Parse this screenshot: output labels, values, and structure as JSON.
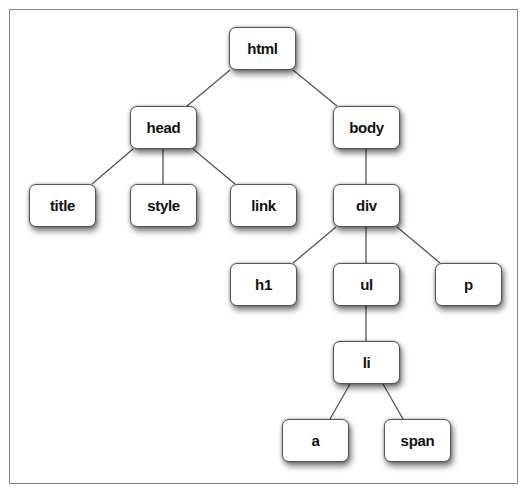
{
  "diagram": {
    "type": "tree",
    "nodes": [
      {
        "id": "html",
        "label": "html",
        "x": 229,
        "y": 27
      },
      {
        "id": "head",
        "label": "head",
        "x": 130,
        "y": 106
      },
      {
        "id": "body",
        "label": "body",
        "x": 333,
        "y": 106
      },
      {
        "id": "title",
        "label": "title",
        "x": 29,
        "y": 184
      },
      {
        "id": "style",
        "label": "style",
        "x": 130,
        "y": 184
      },
      {
        "id": "link",
        "label": "link",
        "x": 230,
        "y": 184
      },
      {
        "id": "div",
        "label": "div",
        "x": 333,
        "y": 184
      },
      {
        "id": "h1",
        "label": "h1",
        "x": 230,
        "y": 263
      },
      {
        "id": "ul",
        "label": "ul",
        "x": 333,
        "y": 263
      },
      {
        "id": "p",
        "label": "p",
        "x": 435,
        "y": 263
      },
      {
        "id": "li",
        "label": "li",
        "x": 333,
        "y": 341
      },
      {
        "id": "a",
        "label": "a",
        "x": 282,
        "y": 419
      },
      {
        "id": "span",
        "label": "span",
        "x": 384,
        "y": 419
      }
    ],
    "edges": [
      [
        "html",
        "head"
      ],
      [
        "html",
        "body"
      ],
      [
        "head",
        "title"
      ],
      [
        "head",
        "style"
      ],
      [
        "head",
        "link"
      ],
      [
        "body",
        "div"
      ],
      [
        "div",
        "h1"
      ],
      [
        "div",
        "ul"
      ],
      [
        "div",
        "p"
      ],
      [
        "ul",
        "li"
      ],
      [
        "li",
        "a"
      ],
      [
        "li",
        "span"
      ]
    ]
  },
  "labels": {
    "html": "html",
    "head": "head",
    "body": "body",
    "title": "title",
    "style": "style",
    "link": "link",
    "div": "div",
    "h1": "h1",
    "ul": "ul",
    "p": "p",
    "li": "li",
    "a": "a",
    "span": "span"
  }
}
